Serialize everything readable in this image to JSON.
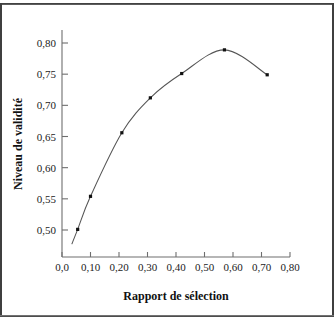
{
  "figure": {
    "name": "validity-selection-ratio-chart",
    "background_color": "#ffffff",
    "frame_color": "#3f3f3f",
    "curve_color": "#555555",
    "marker_color": "#111111",
    "axis_color": "#6e6e6e"
  },
  "chart_data": {
    "type": "line",
    "title": "",
    "xlabel": "Rapport de sélection",
    "ylabel": "Niveau de validité",
    "xlim": [
      0.0,
      0.8
    ],
    "ylim": [
      0.465,
      0.815
    ],
    "grid": false,
    "legend": null,
    "x_tick_labels": [
      "0,0",
      "0,10",
      "0,20",
      "0,30",
      "0,40",
      "0,50",
      "0,60",
      "0,70",
      "0,80"
    ],
    "x_tick_values": [
      0.0,
      0.1,
      0.2,
      0.3,
      0.4,
      0.5,
      0.6,
      0.7,
      0.8
    ],
    "y_tick_labels": [
      "0,50",
      "0,55",
      "0,60",
      "0,65",
      "0,70",
      "0,75",
      "0,80"
    ],
    "y_tick_values": [
      0.5,
      0.55,
      0.6,
      0.65,
      0.7,
      0.75,
      0.8
    ],
    "x": [
      0.055,
      0.1,
      0.21,
      0.31,
      0.42,
      0.57,
      0.72
    ],
    "values": [
      0.501,
      0.554,
      0.656,
      0.712,
      0.751,
      0.789,
      0.749
    ],
    "markers": true,
    "curve_extends_below_first_point": true,
    "curve_start_x": 0.035,
    "curve_start_y": 0.478
  }
}
